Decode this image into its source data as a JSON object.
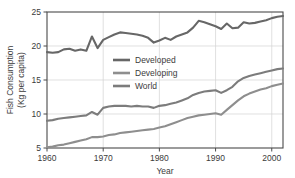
{
  "chart_data": {
    "type": "line",
    "title": "",
    "xlabel": "Year",
    "ylabel": "Fish Consumption (Kg per capita)",
    "ylabel_line1": "Fish Consumption",
    "ylabel_line2": "(Kg per capita)",
    "xlim": [
      1960,
      2002
    ],
    "ylim": [
      5,
      25
    ],
    "xticks": [
      1960,
      1970,
      1980,
      1990,
      2000
    ],
    "xtick_labels": [
      "1960",
      "1970",
      "1980",
      "1990",
      "2000"
    ],
    "yticks": [
      5,
      10,
      15,
      20,
      25
    ],
    "ytick_labels": [
      "5",
      "10",
      "15",
      "20",
      "25"
    ],
    "grid": true,
    "legend_position": "center-left",
    "x": [
      1960,
      1961,
      1962,
      1963,
      1964,
      1965,
      1966,
      1967,
      1968,
      1969,
      1970,
      1971,
      1972,
      1973,
      1974,
      1975,
      1976,
      1977,
      1978,
      1979,
      1980,
      1981,
      1982,
      1983,
      1984,
      1985,
      1986,
      1987,
      1988,
      1989,
      1990,
      1991,
      1992,
      1993,
      1994,
      1995,
      1996,
      1997,
      1998,
      1999,
      2000,
      2001,
      2002
    ],
    "series": [
      {
        "name": "Developed",
        "color": "#676767",
        "values": [
          19.1,
          19.0,
          19.1,
          19.5,
          19.6,
          19.3,
          19.5,
          19.3,
          21.4,
          19.7,
          20.9,
          21.3,
          21.7,
          22.0,
          21.9,
          21.8,
          21.7,
          21.5,
          21.2,
          20.5,
          20.8,
          21.2,
          20.9,
          21.4,
          21.7,
          22.0,
          22.7,
          23.7,
          23.5,
          23.2,
          22.9,
          22.5,
          23.3,
          22.6,
          22.7,
          23.5,
          23.3,
          23.4,
          23.6,
          23.8,
          24.1,
          24.3,
          24.4
        ]
      },
      {
        "name": "Developing",
        "color": "#8e8e8e",
        "values": [
          5.1,
          5.2,
          5.4,
          5.5,
          5.7,
          5.9,
          6.1,
          6.3,
          6.6,
          6.6,
          6.7,
          6.9,
          7.0,
          7.2,
          7.3,
          7.4,
          7.5,
          7.6,
          7.7,
          7.8,
          8.0,
          8.2,
          8.5,
          8.8,
          9.1,
          9.4,
          9.6,
          9.8,
          9.9,
          10.0,
          10.1,
          9.9,
          10.6,
          11.3,
          12.0,
          12.6,
          13.0,
          13.3,
          13.6,
          13.8,
          14.1,
          14.3,
          14.5
        ]
      },
      {
        "name": "World",
        "color": "#7c7c7c",
        "values": [
          9.0,
          9.1,
          9.3,
          9.4,
          9.5,
          9.6,
          9.7,
          9.8,
          10.3,
          9.9,
          10.9,
          11.1,
          11.2,
          11.2,
          11.2,
          11.1,
          11.2,
          11.1,
          11.1,
          10.9,
          11.2,
          11.3,
          11.5,
          11.7,
          12.0,
          12.3,
          12.8,
          13.1,
          13.3,
          13.4,
          13.5,
          13.1,
          13.5,
          14.0,
          14.8,
          15.3,
          15.6,
          15.8,
          16.0,
          16.2,
          16.4,
          16.6,
          16.7
        ]
      }
    ]
  },
  "legend": {
    "items": [
      {
        "label": "Developed",
        "color": "#676767"
      },
      {
        "label": "Developing",
        "color": "#8e8e8e"
      },
      {
        "label": "World",
        "color": "#7c7c7c"
      }
    ]
  }
}
